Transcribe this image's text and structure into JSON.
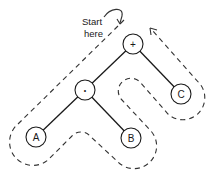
{
  "diagram": {
    "title": "",
    "annotation": {
      "line1": "Start",
      "line2": "here"
    },
    "nodes": [
      {
        "id": "plus",
        "label": "+"
      },
      {
        "id": "times",
        "label": "•"
      },
      {
        "id": "A",
        "label": "A"
      },
      {
        "id": "B",
        "label": "B"
      },
      {
        "id": "C",
        "label": "C"
      }
    ],
    "edges": [
      {
        "from": "plus",
        "to": "times"
      },
      {
        "from": "plus",
        "to": "C"
      },
      {
        "from": "times",
        "to": "A"
      },
      {
        "from": "times",
        "to": "B"
      }
    ],
    "traversal": {
      "style": "dashed",
      "order": [
        "plus",
        "times",
        "A",
        "B",
        "C",
        "plus"
      ]
    },
    "colors": {
      "ink": "#1a1a1a",
      "background": "#ffffff"
    }
  }
}
